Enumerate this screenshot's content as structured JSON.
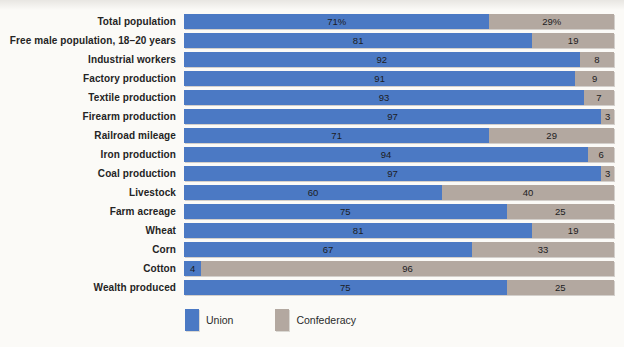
{
  "chart_data": {
    "type": "bar",
    "subtype": "stacked-horizontal-percent",
    "orientation": "horizontal",
    "unit": "percent",
    "xlim": [
      0,
      100
    ],
    "grid": false,
    "legend_position": "bottom",
    "categories": [
      "Total population",
      "Free male population, 18–20 years",
      "Industrial workers",
      "Factory production",
      "Textile production",
      "Firearm production",
      "Railroad mileage",
      "Iron production",
      "Coal production",
      "Livestock",
      "Farm acreage",
      "Wheat",
      "Corn",
      "Cotton",
      "Wealth produced"
    ],
    "series": [
      {
        "name": "Union",
        "color": "#4b79c4",
        "values": [
          71,
          81,
          92,
          91,
          93,
          97,
          71,
          94,
          97,
          60,
          75,
          81,
          67,
          4,
          75
        ],
        "labels": [
          "71%",
          "81",
          "92",
          "91",
          "93",
          "97",
          "71",
          "94",
          "97",
          "60",
          "75",
          "81",
          "67",
          "4",
          "75"
        ]
      },
      {
        "name": "Confederacy",
        "color": "#b3a8a0",
        "values": [
          29,
          19,
          8,
          9,
          7,
          3,
          29,
          6,
          3,
          40,
          25,
          19,
          33,
          96,
          25
        ],
        "labels": [
          "29%",
          "19",
          "8",
          "9",
          "7",
          "3",
          "29",
          "6",
          "3",
          "40",
          "25",
          "19",
          "33",
          "96",
          "25"
        ]
      }
    ]
  },
  "legend": {
    "items": [
      {
        "label": "Union",
        "color": "#4b79c4"
      },
      {
        "label": "Confederacy",
        "color": "#b3a8a0"
      }
    ]
  },
  "caption_clipped": "RESOURCES OF THE UNION AND THE CONFEDERACY"
}
